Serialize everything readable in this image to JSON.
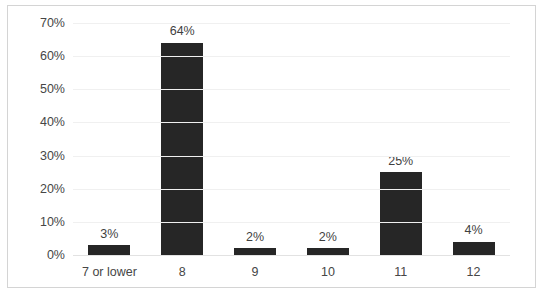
{
  "chart_data": {
    "type": "bar",
    "title": "",
    "subtitle": "",
    "xlabel": "",
    "ylabel": "",
    "categories": [
      "7 or lower",
      "8",
      "9",
      "10",
      "11",
      "12"
    ],
    "values": [
      3,
      25,
      2,
      2,
      25,
      4
    ],
    "value_labels": [
      "3%",
      "64%",
      "2%",
      "2%",
      "25%",
      "4%"
    ],
    "series": [
      {
        "name": "",
        "values": [
          3,
          64,
          2,
          2,
          25,
          4
        ]
      }
    ],
    "ylim": [
      0,
      70
    ],
    "ytick_values": [
      0,
      10,
      20,
      30,
      40,
      50,
      60,
      70
    ],
    "ytick_labels": [
      "0%",
      "10%",
      "20%",
      "30%",
      "40%",
      "50%",
      "60%",
      "70%"
    ],
    "grid": true,
    "legend": false,
    "legend_position": "none",
    "annotations": [],
    "colors": {
      "bar": "#262626",
      "gridline": "#f0f0f0",
      "baseline": "#e2e2e2",
      "frame_border": "#d4d4d4",
      "tick_text": "#464646",
      "label_text": "#3f3f3f",
      "background": "#ffffff"
    }
  }
}
